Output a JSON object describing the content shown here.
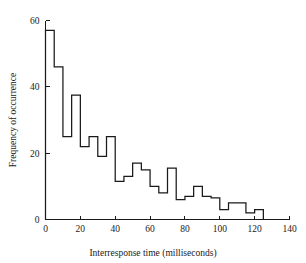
{
  "chart_data": {
    "type": "bar",
    "title": "",
    "subtitle": "",
    "xlabel": "Interresponse time (milliseconds)",
    "ylabel": "Frequency of occurrence",
    "xlim": [
      0,
      140
    ],
    "ylim": [
      0,
      60
    ],
    "bin_width": 5,
    "grid": false,
    "legend": null,
    "xticks": [
      0,
      20,
      40,
      60,
      80,
      100,
      120,
      140
    ],
    "yticks": [
      0,
      20,
      40,
      60
    ],
    "xtick_labels": [
      "0",
      "20",
      "40",
      "60",
      "80",
      "100",
      "120",
      "140"
    ],
    "ytick_labels": [
      "0",
      "20",
      "40",
      "60"
    ],
    "bin_starts": [
      0,
      5,
      10,
      15,
      20,
      25,
      30,
      35,
      40,
      45,
      50,
      55,
      60,
      65,
      70,
      75,
      80,
      85,
      90,
      95,
      100,
      105,
      110,
      115,
      120
    ],
    "categories": [
      "0-5",
      "5-10",
      "10-15",
      "15-20",
      "20-25",
      "25-30",
      "30-35",
      "35-40",
      "40-45",
      "45-50",
      "50-55",
      "55-60",
      "60-65",
      "65-70",
      "70-75",
      "75-80",
      "80-85",
      "85-90",
      "90-95",
      "95-100",
      "100-105",
      "105-110",
      "110-115",
      "115-120",
      "120-125"
    ],
    "values": [
      57,
      46,
      25,
      37.5,
      22,
      25,
      19,
      25,
      11.5,
      13,
      17,
      15,
      10,
      8,
      15.5,
      6,
      7,
      10,
      7,
      6.5,
      3,
      5,
      5,
      2,
      3
    ],
    "line_color": "#1a1a1a",
    "background_color": "#ffffff"
  },
  "axis": {
    "x_label": "Interresponse time (milliseconds)",
    "y_label": "Frequency of occurrence"
  }
}
